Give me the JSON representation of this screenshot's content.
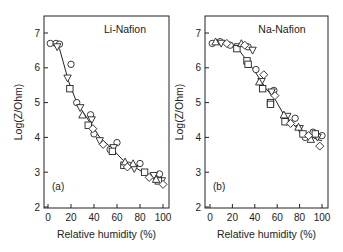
{
  "chart_data": [
    {
      "type": "scatter",
      "panel_label": "(a)",
      "title": "Li-Nafion",
      "xlabel": "Relative humidity (%)",
      "ylabel": "Log(Z/Ohm)",
      "xlim": [
        0,
        100
      ],
      "ylim": [
        2,
        7.5
      ],
      "xticks": [
        0,
        20,
        40,
        60,
        80,
        100
      ],
      "yticks": [
        2,
        3,
        4,
        5,
        6,
        7
      ],
      "grid": false,
      "fit_line": [
        [
          3,
          6.75
        ],
        [
          10,
          6.55
        ],
        [
          18,
          5.6
        ],
        [
          25,
          5.0
        ],
        [
          35,
          4.5
        ],
        [
          45,
          4.0
        ],
        [
          55,
          3.7
        ],
        [
          65,
          3.35
        ],
        [
          75,
          3.15
        ],
        [
          85,
          2.95
        ],
        [
          95,
          2.8
        ],
        [
          100,
          2.7
        ]
      ],
      "series": [
        {
          "name": "circle",
          "marker": "circle",
          "points": [
            [
              2,
              6.7
            ],
            [
              7,
              6.7
            ],
            [
              10,
              6.68
            ],
            [
              20,
              6.1
            ],
            [
              25,
              5.0
            ],
            [
              37,
              4.65
            ],
            [
              40,
              4.1
            ],
            [
              54,
              3.65
            ],
            [
              60,
              3.85
            ],
            [
              70,
              3.2
            ],
            [
              80,
              3.25
            ],
            [
              97,
              2.95
            ]
          ]
        },
        {
          "name": "triangle-down",
          "marker": "triangle-down",
          "points": [
            [
              8,
              6.6
            ],
            [
              17,
              5.7
            ],
            [
              28,
              4.85
            ],
            [
              38,
              4.5
            ],
            [
              45,
              3.9
            ],
            [
              57,
              3.7
            ],
            [
              75,
              3.1
            ],
            [
              92,
              2.9
            ],
            [
              99,
              2.75
            ]
          ]
        },
        {
          "name": "square",
          "marker": "square",
          "points": [
            [
              19,
              5.4
            ],
            [
              35,
              4.35
            ],
            [
              56,
              3.6
            ],
            [
              66,
              3.2
            ],
            [
              84,
              3.0
            ],
            [
              96,
              2.75
            ]
          ]
        },
        {
          "name": "triangle-up",
          "marker": "triangle-up",
          "points": [
            [
              30,
              4.65
            ],
            [
              67,
              3.3
            ],
            [
              74,
              3.25
            ],
            [
              94,
              2.8
            ]
          ]
        },
        {
          "name": "diamond",
          "marker": "diamond",
          "points": [
            [
              39,
              4.25
            ],
            [
              48,
              3.8
            ],
            [
              69,
              3.15
            ],
            [
              88,
              2.85
            ],
            [
              100,
              2.65
            ]
          ]
        }
      ]
    },
    {
      "type": "scatter",
      "panel_label": "(b)",
      "title": "Na-Nafion",
      "xlabel": "Relative humidity (%)",
      "ylabel": "Log(Z/Ohm)",
      "xlim": [
        0,
        100
      ],
      "ylim": [
        2,
        7.5
      ],
      "xticks": [
        0,
        20,
        40,
        60,
        80,
        100
      ],
      "yticks": [
        2,
        3,
        4,
        5,
        6,
        7
      ],
      "grid": false,
      "fit_line": [
        [
          3,
          6.75
        ],
        [
          15,
          6.7
        ],
        [
          25,
          6.55
        ],
        [
          33,
          6.2
        ],
        [
          40,
          5.9
        ],
        [
          50,
          5.4
        ],
        [
          58,
          5.1
        ],
        [
          65,
          4.7
        ],
        [
          75,
          4.35
        ],
        [
          85,
          4.1
        ],
        [
          95,
          3.95
        ],
        [
          100,
          3.9
        ]
      ],
      "series": [
        {
          "name": "circle",
          "marker": "circle",
          "points": [
            [
              2,
              6.7
            ],
            [
              9,
              6.75
            ],
            [
              18,
              6.65
            ],
            [
              34,
              6.6
            ],
            [
              41,
              5.95
            ],
            [
              57,
              5.35
            ],
            [
              68,
              4.45
            ],
            [
              76,
              4.55
            ],
            [
              85,
              4.0
            ],
            [
              92,
              4.15
            ],
            [
              100,
              4.05
            ]
          ]
        },
        {
          "name": "triangle-down",
          "marker": "triangle-down",
          "points": [
            [
              10,
              6.7
            ],
            [
              25,
              6.6
            ],
            [
              38,
              6.5
            ],
            [
              46,
              5.6
            ],
            [
              55,
              5.3
            ],
            [
              69,
              4.6
            ],
            [
              80,
              4.25
            ],
            [
              96,
              4.0
            ]
          ]
        },
        {
          "name": "square",
          "marker": "square",
          "points": [
            [
              24,
              6.55
            ],
            [
              33,
              6.2
            ],
            [
              34,
              6.1
            ],
            [
              47,
              5.4
            ],
            [
              54,
              5.0
            ],
            [
              54,
              4.95
            ],
            [
              67,
              4.45
            ],
            [
              83,
              4.1
            ],
            [
              94,
              4.1
            ]
          ]
        },
        {
          "name": "triangle-up",
          "marker": "triangle-up",
          "points": [
            [
              5,
              6.75
            ],
            [
              28,
              6.7
            ],
            [
              44,
              5.6
            ],
            [
              66,
              4.65
            ],
            [
              79,
              4.3
            ],
            [
              90,
              3.95
            ]
          ]
        },
        {
          "name": "diamond",
          "marker": "diamond",
          "points": [
            [
              15,
              6.7
            ],
            [
              31,
              6.65
            ],
            [
              48,
              5.8
            ],
            [
              58,
              5.2
            ],
            [
              72,
              4.4
            ],
            [
              88,
              4.05
            ],
            [
              98,
              3.75
            ]
          ]
        }
      ]
    }
  ],
  "panels": [
    {
      "label": "(a)",
      "title": "Li-Nafion",
      "xlabel": "Relative humidity (%)",
      "ylabel": "Log(Z/Ohm)"
    },
    {
      "label": "(b)",
      "title": "Na-Nafion",
      "xlabel": "Relative humidity (%)",
      "ylabel": "Log(Z/Ohm)"
    }
  ],
  "colors": {
    "ink": "#222222",
    "background": "#ffffff"
  }
}
